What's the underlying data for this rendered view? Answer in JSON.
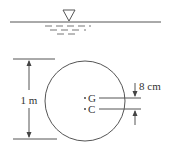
{
  "diagram": {
    "type": "floating-cylinder-cross-section",
    "water_surface_symbol": "inverted-triangle",
    "diameter_label": "1 m",
    "points": [
      {
        "label": "G"
      },
      {
        "label": "C"
      }
    ],
    "offset_label": "8 cm",
    "colors": {
      "stroke": "#555555",
      "text": "#333333"
    }
  }
}
